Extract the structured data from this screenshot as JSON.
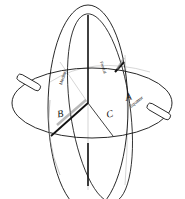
{
  "diagram": {
    "type": "three intersecting orthogonal planes within a sphere",
    "planes": [
      {
        "id": "A",
        "label": "A",
        "caption": "Equator",
        "orientation": "horizontal"
      },
      {
        "id": "B",
        "label": "B",
        "caption": "Median",
        "orientation": "vertical-left"
      },
      {
        "id": "C",
        "label": "C",
        "caption": "Frontal",
        "orientation": "vertical-right"
      }
    ],
    "colors": {
      "stroke": "#111111",
      "light_stroke": "#bbbbbb",
      "background": "#ffffff"
    }
  }
}
